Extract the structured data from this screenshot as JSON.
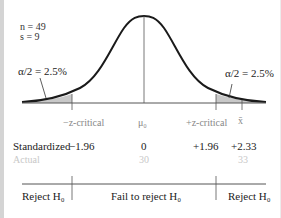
{
  "stats": {
    "n": "n = 49",
    "s": "s = 9"
  },
  "tails": {
    "left_alpha": "α/2 = 2.5%",
    "right_alpha": "α/2 = 2.5%"
  },
  "axis_labels": {
    "neg_crit": "−z-critical",
    "mu0": "μ₀",
    "pos_crit": "+z-critical",
    "xbar": "x̄"
  },
  "standardized": {
    "label": "Standardized",
    "neg_crit": "−1.96",
    "center": "0",
    "pos_crit": "+1.96",
    "xbar": "+2.33"
  },
  "actual": {
    "label": "Actual",
    "center": "30",
    "xbar": "33"
  },
  "regions": {
    "left": "Reject H₀",
    "middle": "Fail to reject H₀",
    "right": "Reject H₀"
  },
  "colors": {
    "shade": "#c8c8c8",
    "curve": "#1a1a1a",
    "axis": "#555555",
    "border": "#d4d4d4"
  }
}
